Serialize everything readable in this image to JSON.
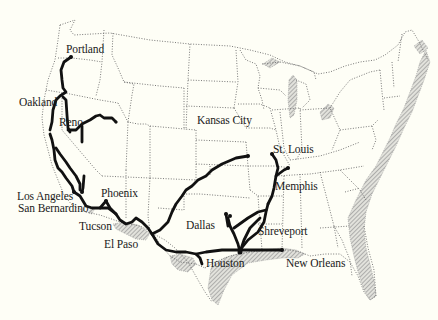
{
  "map": {
    "title": "",
    "background": "#fefef6",
    "route_color": "#111111",
    "coast_shading": "#a8a8a8"
  },
  "cities": [
    {
      "id": "portland",
      "name": "Portland",
      "x": 66,
      "y": 44
    },
    {
      "id": "oakland",
      "name": "Oakland",
      "x": 19,
      "y": 97
    },
    {
      "id": "reno",
      "name": "Reno",
      "x": 59,
      "y": 117
    },
    {
      "id": "kansas-city",
      "name": "Kansas City",
      "x": 197,
      "y": 115
    },
    {
      "id": "st-louis",
      "name": "St. Louis",
      "x": 273,
      "y": 144
    },
    {
      "id": "memphis",
      "name": "Memphis",
      "x": 275,
      "y": 181
    },
    {
      "id": "los-angeles",
      "name": "Los Angeles",
      "x": 17,
      "y": 191
    },
    {
      "id": "san-bernardino",
      "name": "San Bernardino",
      "x": 18,
      "y": 203
    },
    {
      "id": "phoenix",
      "name": "Phoenix",
      "x": 101,
      "y": 188
    },
    {
      "id": "tucson",
      "name": "Tucson",
      "x": 79,
      "y": 221
    },
    {
      "id": "el-paso",
      "name": "El Paso",
      "x": 104,
      "y": 239
    },
    {
      "id": "dallas",
      "name": "Dallas",
      "x": 186,
      "y": 220
    },
    {
      "id": "shreveport",
      "name": "Shreveport",
      "x": 258,
      "y": 226
    },
    {
      "id": "houston",
      "name": "Houston",
      "x": 206,
      "y": 258
    },
    {
      "id": "new-orleans",
      "name": "New Orleans",
      "x": 286,
      "y": 258
    }
  ]
}
